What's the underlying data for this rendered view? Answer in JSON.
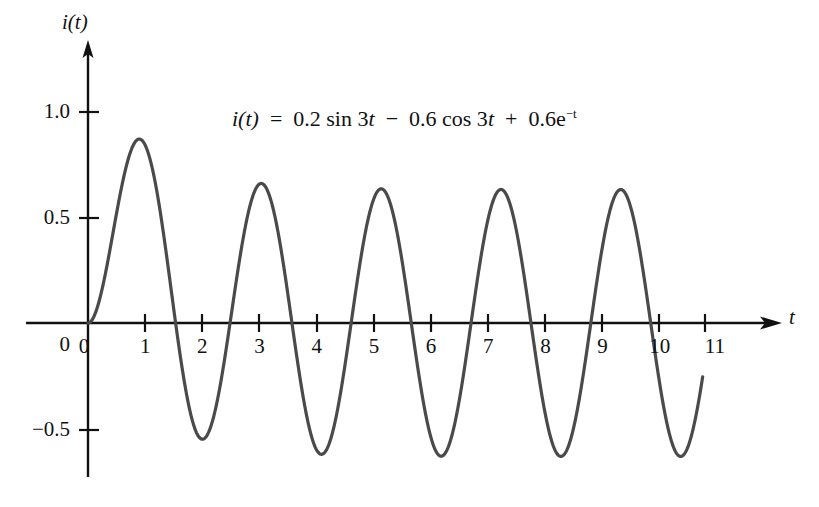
{
  "figure": {
    "equation_plain": "i(t) = 0.2 sin 3t − 0.6 cos 3t + 0.6e−t",
    "axis_titles": {
      "y": "i(t)",
      "x": "t"
    }
  },
  "equation_parts": {
    "lhs": "i(t)",
    "eq": "=",
    "term1": "0.2 sin 3",
    "var1": "t",
    "minus": "−",
    "term2": "0.6 cos 3",
    "var2": "t",
    "plus": "+",
    "term3": "0.6e",
    "exp": "−t"
  },
  "chart_data": {
    "type": "line",
    "title": "",
    "subtitle": "",
    "annotations": [
      "i(t)  =  0.2 sin 3t  −  0.6 cos 3t  +  0.6e−t"
    ],
    "xlabel": "t",
    "ylabel": "i(t)",
    "xlim": [
      0,
      11.6
    ],
    "ylim": [
      -0.72,
      1.15
    ],
    "grid": false,
    "legend": null,
    "xticks": [
      0,
      1,
      2,
      3,
      4,
      5,
      6,
      7,
      8,
      9,
      10,
      11
    ],
    "xtick_labels": [
      "0",
      "1",
      "2",
      "3",
      "4",
      "5",
      "6",
      "7",
      "8",
      "9",
      "10",
      "11"
    ],
    "yticks": [
      1.0,
      0.5,
      0,
      -0.5
    ],
    "ytick_labels": [
      "1.0",
      "0.5",
      "0",
      "−0.5"
    ],
    "series": [
      {
        "name": "i(t) = 0.2 sin 3t − 0.6 cos 3t + 0.6e−t",
        "color": "#4a4a4a",
        "linewidth": 3,
        "expression": "0.2*sin(3t) - 0.6*cos(3t) + 0.6*exp(-t)",
        "t_start": 0,
        "t_end": 10.75,
        "features": {
          "period": 2.094,
          "first_peak": {
            "t": 0.87,
            "i": 0.88
          },
          "first_trough": {
            "t": 2.1,
            "i": -0.56
          },
          "steady_amplitude": 0.632,
          "steady_peaks": [
            {
              "t": 2.96,
              "i": 0.66
            },
            {
              "t": 5.05,
              "i": 0.65
            },
            {
              "t": 7.15,
              "i": 0.65
            },
            {
              "t": 9.24,
              "i": 0.65
            }
          ],
          "steady_troughs": [
            {
              "t": 4.0,
              "i": -0.61
            },
            {
              "t": 6.1,
              "i": -0.63
            },
            {
              "t": 8.2,
              "i": -0.63
            },
            {
              "t": 10.3,
              "i": -0.63
            }
          ],
          "end_point": {
            "t": 10.75,
            "i": 0.24
          }
        }
      }
    ]
  },
  "axis_style": {
    "color": "#111111",
    "arrow_x": true,
    "arrow_y": true,
    "curve_color": "#4a4a4a"
  }
}
